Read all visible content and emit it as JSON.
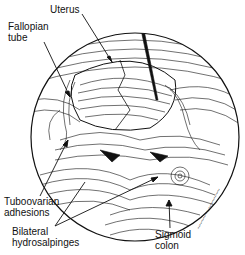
{
  "figure": {
    "labels": {
      "uterus": "Uterus",
      "fallopian_tube": "Fallopian\ntube",
      "tuboovarian_adhesions": "Tuboovarian\nadhesions",
      "bilateral_hydrosalpinges": "Bilateral\nhydrosalpinges",
      "sigmoid_colon": "Sigmoid\ncolon"
    },
    "signature": "artist signature",
    "colors": {
      "ink": "#111111",
      "background": "#ffffff"
    }
  }
}
